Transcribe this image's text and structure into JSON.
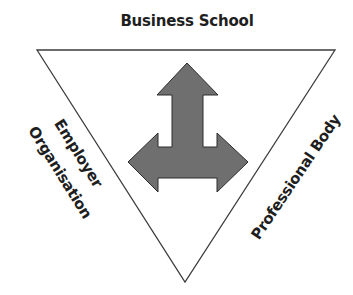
{
  "diagram": {
    "type": "inverted-triangle-stakeholder",
    "top_label": "Business School",
    "left_label": {
      "line1": "Employer",
      "line2": "Organisation"
    },
    "right_label": "Professional Body",
    "center_icon": "three-way-arrow-icon",
    "colors": {
      "triangle_stroke": "#3c3c3c",
      "arrow_fill": "#6f6f6f",
      "arrow_stroke": "#2c2c2c",
      "text": "#1e1e1e"
    }
  }
}
